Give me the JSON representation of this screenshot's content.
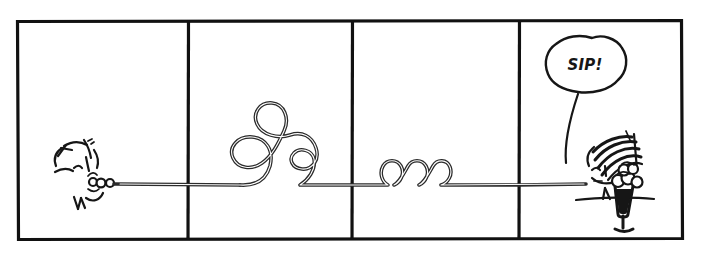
{
  "comic": {
    "title": "Long curly straw comic strip",
    "medium": "hand-drawn black ink line art on white paper",
    "panel_count": 4,
    "background_color": "#ffffff",
    "ink_color": "#161616",
    "frame": {
      "x": 16,
      "y": 20,
      "width": 667,
      "height": 220,
      "stroke_width": 3.2,
      "divider_x": [
        188,
        352,
        519
      ]
    },
    "panels": [
      {
        "index": 1,
        "name": "panel-1-drinker",
        "contents": "side profile of a face with spiky hair sipping on a straw; small lip circles around the straw tip",
        "bounds": {
          "x": 16,
          "y": 20,
          "width": 172,
          "height": 220
        }
      },
      {
        "index": 2,
        "name": "panel-2-big-loops",
        "contents": "the straw rises into two large curly loops and a smaller loop before returning to the baseline",
        "bounds": {
          "x": 188,
          "y": 20,
          "width": 164,
          "height": 220
        }
      },
      {
        "index": 3,
        "name": "panel-3-small-coils",
        "contents": "the straw forms three small tight coils sitting on the baseline",
        "bounds": {
          "x": 352,
          "y": 20,
          "width": 167,
          "height": 220
        }
      },
      {
        "index": 4,
        "name": "panel-4-milkshake",
        "contents": "a second face with striped hair behind a counter, a tall milkshake glass topped with whipped cream, and a speech balloon",
        "bounds": {
          "x": 519,
          "y": 20,
          "width": 164,
          "height": 220
        }
      }
    ],
    "straw": {
      "name": "curly-straw",
      "color": "#2b2b2b",
      "stroke_width": 3.6,
      "baseline_y": 185,
      "start_x": 60,
      "end_x": 586,
      "description": "one continuous straw running from the drinker's mouth in panel 1 all the way to the milkshake glass in panel 4"
    },
    "speech_balloon": {
      "name": "speech-balloon",
      "text": "SIP!",
      "shape": "rounded irregular hand-drawn blob",
      "center_x": 585,
      "center_y": 67,
      "tail": "long curving line from balloon bottom down to the figure's head"
    },
    "characters": [
      {
        "name": "drinker-face",
        "panel": 1,
        "facing": "right",
        "features": [
          "spiky hair",
          "eye",
          "nose",
          "mouth",
          "lip circles on straw"
        ]
      },
      {
        "name": "server-face",
        "panel": 4,
        "facing": "left",
        "features": [
          "striped hair or cap",
          "eye",
          "nose",
          "mouth"
        ]
      }
    ],
    "objects": [
      {
        "name": "milkshake-glass",
        "panel": 4,
        "description": "tall footed sundae glass with dark shake and swirled whipped cream on top"
      },
      {
        "name": "counter-line",
        "panel": 4,
        "description": "horizontal table/counter edge the glass rests on"
      }
    ]
  }
}
